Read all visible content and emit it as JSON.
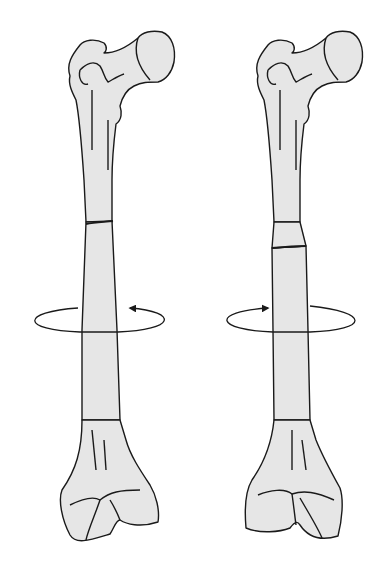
{
  "figure": {
    "colors": {
      "bone_fill": "#e6e6e6",
      "outline": "#1a1a1a",
      "background": "#ffffff"
    },
    "panels": [
      {
        "id": "left",
        "rotation": "counterclockwise-arrow-on-right",
        "arrow_direction": "left"
      },
      {
        "id": "right",
        "rotation": "arrow-on-left",
        "arrow_direction": "right"
      }
    ]
  }
}
